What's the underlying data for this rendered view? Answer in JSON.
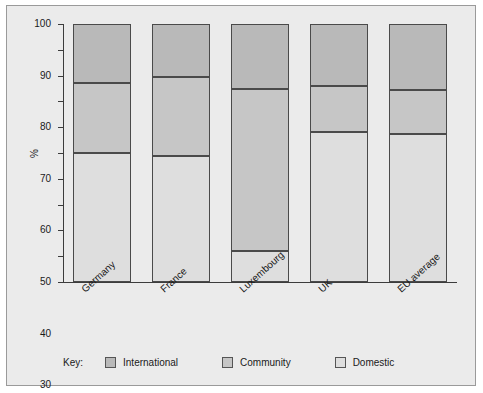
{
  "chart_data": {
    "type": "bar",
    "subtype": "stacked-100-percent",
    "title": "",
    "subtitle": "",
    "xlabel": "",
    "ylabel": "%",
    "ylim": [
      0,
      100
    ],
    "yticks": [
      0,
      10,
      20,
      30,
      40,
      50,
      60,
      70,
      80,
      90,
      100
    ],
    "ytick_labels": [
      "0",
      "10",
      "20",
      "30",
      "40",
      "50",
      "60",
      "70",
      "80",
      "90",
      "100"
    ],
    "grid": false,
    "legend_position": "bottom",
    "legend_title": "Key:",
    "categories": [
      "Germany",
      "France",
      "Luxembourg",
      "UK",
      "EU average"
    ],
    "series": [
      {
        "name": "International",
        "color": "#b9b9b9",
        "values": [
          23,
          20.5,
          25,
          24,
          25.5
        ]
      },
      {
        "name": "Community",
        "color": "#c6c6c6",
        "values": [
          27,
          30.5,
          63,
          18,
          17
        ]
      },
      {
        "name": "Domestic",
        "color": "#dedede",
        "values": [
          50,
          49,
          12,
          58,
          57.5
        ]
      }
    ],
    "stack_boundaries": {
      "Germany": [
        50,
        77,
        100
      ],
      "France": [
        49,
        79.5,
        100
      ],
      "Luxembourg": [
        12,
        75,
        100
      ],
      "UK": [
        58,
        76,
        100
      ],
      "EU average": [
        57.5,
        74.5,
        100
      ]
    }
  },
  "axis": {
    "y_title": "%",
    "ticks": [
      "100",
      "90",
      "80",
      "70",
      "60",
      "50",
      "40",
      "30",
      "20",
      "10",
      "0"
    ]
  },
  "categories": {
    "germany": "Germany",
    "france": "France",
    "luxembourg": "Luxembourg",
    "uk": "UK",
    "eu_average": "EU average"
  },
  "legend": {
    "title": "Key:",
    "entries": [
      {
        "label": "International",
        "color": "#b9b9b9"
      },
      {
        "label": "Community",
        "color": "#c6c6c6"
      },
      {
        "label": "Domestic",
        "color": "#dedede"
      }
    ]
  },
  "colors": {
    "panel_background": "#ebebeb",
    "panel_border": "#9a9a9a",
    "axis": "#3c3c3c",
    "bar_outline": "#4a4a4a",
    "text": "#1a1a1a"
  }
}
